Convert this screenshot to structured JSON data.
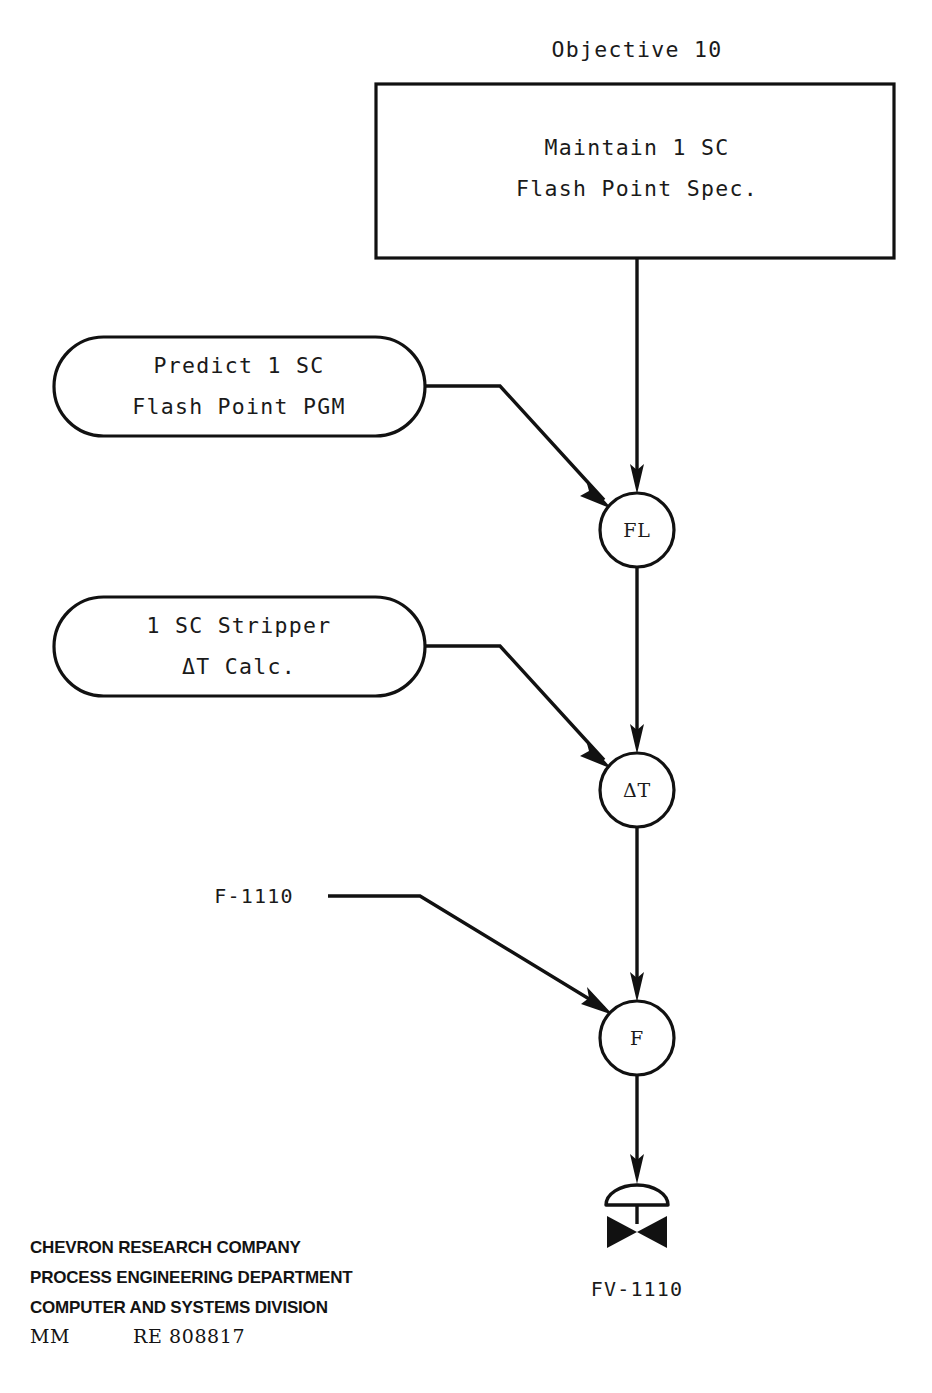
{
  "diagram": {
    "title": "Objective 10",
    "objective_box": {
      "line1": "Maintain 1 SC",
      "line2": "Flash Point Spec."
    },
    "program_blocks": [
      {
        "name": "predict-flash-point",
        "line1": "Predict 1 SC",
        "line2": "Flash Point PGM"
      },
      {
        "name": "stripper-delta-t",
        "line1": "1 SC Stripper",
        "line2": "ΔT Calc."
      }
    ],
    "nodes": [
      {
        "name": "fl-node",
        "label": "FL"
      },
      {
        "name": "delta-t-node",
        "label": "ΔT"
      },
      {
        "name": "f-node",
        "label": "F"
      }
    ],
    "input_tag": "F-1110",
    "valve_tag": "FV-1110",
    "colors": {
      "ink": "#111111",
      "paper": "#ffffff"
    }
  },
  "footer": {
    "line1": "CHEVRON RESEARCH COMPANY",
    "line2": "PROCESS ENGINEERING DEPARTMENT",
    "line3": "COMPUTER AND SYSTEMS DIVISION",
    "initials": "MM",
    "document_number": "RE  808817"
  }
}
